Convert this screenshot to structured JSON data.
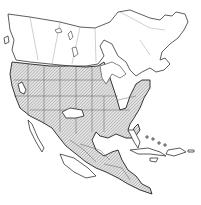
{
  "map": {
    "subject": "North America species range map",
    "regions": [
      "Canada",
      "United States",
      "Mexico",
      "Central America",
      "Caribbean"
    ],
    "legend": [],
    "colors": {
      "background": "#ffffff",
      "outline": "#333333",
      "range_hatch": "#9a9a9a"
    }
  }
}
